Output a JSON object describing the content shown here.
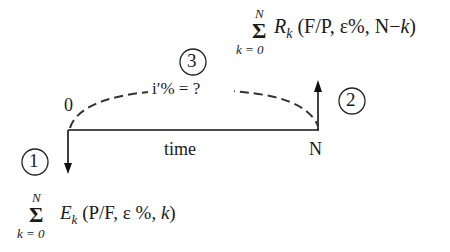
{
  "diagram": {
    "timeline": {
      "start_label": "0",
      "end_label": "N",
      "axis_label": "time"
    },
    "markers": [
      {
        "number": "1",
        "description": "expenses cash flow (downward arrow at 0)"
      },
      {
        "number": "2",
        "description": "receipts cash flow (upward arrow at N)"
      },
      {
        "number": "3",
        "description": "equivalence rate"
      }
    ],
    "rate_label": "i′% = ?",
    "top_formula": {
      "sum_symbol": "Σ",
      "upper_limit": "N",
      "lower_limit": "k = 0",
      "term": "R",
      "subscript": "k",
      "args_open": "(F/P, ε%, N−",
      "args_k": "k",
      "args_close": ")"
    },
    "bottom_formula": {
      "sum_symbol": "Σ",
      "upper_limit": "N",
      "lower_limit": "k = 0",
      "term": "E",
      "subscript": "k",
      "args_open": "(P/F, ε %, ",
      "args_k": "k",
      "args_close": ")"
    }
  }
}
